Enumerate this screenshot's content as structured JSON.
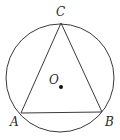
{
  "figure": {
    "circle": {
      "cx": 60,
      "cy": 78,
      "r": 54,
      "stroke": "#3a3a3a"
    },
    "center": {
      "x": 61,
      "y": 87,
      "label": "O",
      "label_x": 49,
      "label_y": 84,
      "fill": "#111111"
    },
    "vertices": {
      "A": {
        "x": 21,
        "y": 113,
        "label": "A",
        "label_x": 10,
        "label_y": 126
      },
      "B": {
        "x": 102,
        "y": 112,
        "label": "B",
        "label_x": 105,
        "label_y": 126
      },
      "C": {
        "x": 61,
        "y": 23,
        "label": "C",
        "label_x": 56,
        "label_y": 16
      }
    },
    "line_color": "#3a3a3a"
  }
}
